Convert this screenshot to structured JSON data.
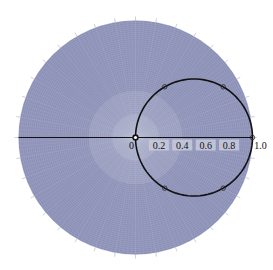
{
  "chart_data": {
    "type": "polar-line",
    "title": "",
    "radial_axis": {
      "range": [
        0,
        1.0
      ],
      "tick_labels": [
        "0",
        "0.2",
        "0.4",
        "0.6",
        "0.8",
        "1.0"
      ]
    },
    "angular_axis": {
      "tick_step_deg": 10,
      "label_format": "paired angle labels (two numbers each, top and bottom); exact values too blurry to read reliably",
      "legible_labels": [
        "270/90 (top)",
        "180 (left)",
        "360/0 (right, near 1.0)"
      ]
    },
    "series": [
      {
        "name": "r = cos(theta)",
        "description": "circle through origin and (1,0), centered at r=0.5, theta=0",
        "markers_deg": [
          -60,
          -30,
          0,
          30,
          60
        ],
        "stroke": "#111111"
      }
    ],
    "colors": {
      "grid_fill": "#8b90b6",
      "grid_line": "#c9cce0",
      "curve": "#111111",
      "label_box": "#c8cadc"
    }
  }
}
